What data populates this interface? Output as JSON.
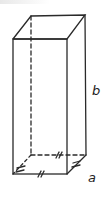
{
  "figure": {
    "type": "rectangular prism (square base)",
    "labels": {
      "height": "b",
      "base_side": "a"
    },
    "colors": {
      "stroke": "#2a2a2a",
      "background": "#ffffff"
    },
    "tick_marks": "double ticks on base edges indicating equal lengths"
  }
}
